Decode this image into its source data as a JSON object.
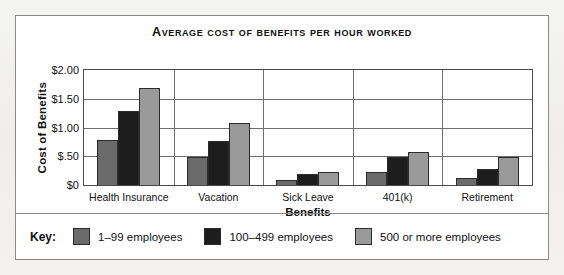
{
  "chart_data": {
    "type": "bar",
    "title": "Average Cost of Benefits per Hour Worked",
    "xlabel": "Benefits",
    "ylabel": "Cost of Benefits",
    "categories": [
      "Health Insurance",
      "Vacation",
      "Sick Leave",
      "401(k)",
      "Retirement"
    ],
    "series": [
      {
        "name": "1–99 employees",
        "color": "#6b6b6b",
        "values": [
          0.78,
          0.49,
          0.09,
          0.23,
          0.13
        ]
      },
      {
        "name": "100–499 employees",
        "color": "#1d1d1d",
        "values": [
          1.28,
          0.77,
          0.19,
          0.48,
          0.28
        ]
      },
      {
        "name": "500 or more employees",
        "color": "#9a9a9a",
        "values": [
          1.69,
          1.08,
          0.23,
          0.57,
          0.48
        ]
      }
    ],
    "ylim": [
      0,
      2.0
    ],
    "yticks": [
      {
        "value": 0,
        "label": "$0"
      },
      {
        "value": 0.5,
        "label": "$.50"
      },
      {
        "value": 1.0,
        "label": "$1.00"
      },
      {
        "value": 1.5,
        "label": "$1.50"
      },
      {
        "value": 2.0,
        "label": "$2.00"
      }
    ],
    "grid": true,
    "legend_position": "bottom",
    "legend_title": "Key:"
  }
}
